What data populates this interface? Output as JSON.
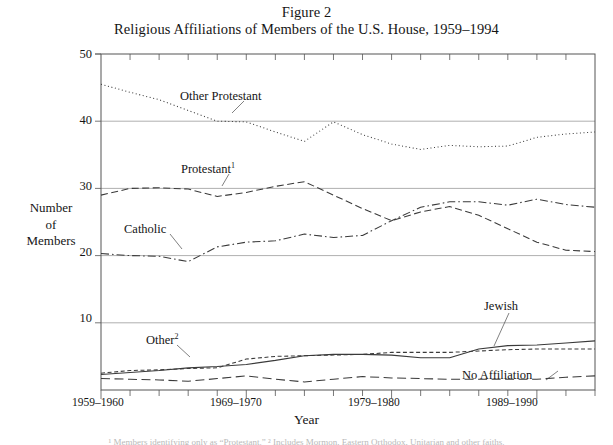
{
  "figure": {
    "title_line_1": "Figure 2",
    "title_line_2": "Religious Affiliations of Members of the U.S. House, 1959–1994",
    "footnote_strip": "¹ Members identifying only as “Protestant.”   ² Includes Mormon, Eastern Orthodox, Unitarian and other faiths."
  },
  "axes": {
    "y_title_line_1": "Number",
    "y_title_line_2": "of",
    "y_title_line_3": "Members",
    "x_title": "Year",
    "y_ticks": [
      "50",
      "40",
      "30",
      "20",
      "10"
    ],
    "x_ticks": [
      "1959–1960",
      "1969–1970",
      "1979–1980",
      "1989–1990"
    ]
  },
  "labels": {
    "other_protestant": "Other Protestant",
    "protestant": "Protestant",
    "protestant_sup": "1",
    "catholic": "Catholic",
    "other": "Other",
    "other_sup": "2",
    "jewish": "Jewish",
    "no_affiliation": "No Affiliation"
  },
  "chart_data": {
    "type": "line",
    "title": "Religious Affiliations of Members of the U.S. House, 1959–1994",
    "subtitle": "Figure 2",
    "xlabel": "Year",
    "ylabel": "Number of Members",
    "ylim": [
      0,
      50
    ],
    "ygrid": true,
    "xgrid": false,
    "legend_position": "inline-annotations",
    "y_ticks": [
      10,
      20,
      30,
      40,
      50
    ],
    "x_tick_labels": [
      "1959–1960",
      "1969–1970",
      "1979–1980",
      "1989–1990"
    ],
    "x_tick_indices": [
      0,
      5,
      10,
      15
    ],
    "categories": [
      "1959–1960",
      "1961–1962",
      "1963–1964",
      "1965–1966",
      "1967–1968",
      "1969–1970",
      "1971–1972",
      "1973–1974",
      "1975–1976",
      "1977–1978",
      "1979–1980",
      "1981–1982",
      "1983–1984",
      "1985–1986",
      "1987–1988",
      "1989–1990",
      "1991–1992",
      "1993–1994"
    ],
    "series": [
      {
        "name": "Other Protestant",
        "style": "dotted",
        "values": [
          45.5,
          44.3,
          43.2,
          41.6,
          40.0,
          39.9,
          38.4,
          37.0,
          39.9,
          38.0,
          36.6,
          35.8,
          36.4,
          36.2,
          36.3,
          37.6,
          38.1,
          38.4
        ]
      },
      {
        "name": "Protestant",
        "style": "dashed",
        "values": [
          29.0,
          30.0,
          30.1,
          29.9,
          28.8,
          29.4,
          30.3,
          31.0,
          29.0,
          27.0,
          25.2,
          26.5,
          27.3,
          26.0,
          24.0,
          22.0,
          20.8,
          20.6
        ]
      },
      {
        "name": "Catholic",
        "style": "dash-dot",
        "values": [
          20.3,
          20.0,
          19.9,
          19.1,
          21.3,
          22.0,
          22.2,
          23.2,
          22.7,
          23.0,
          25.2,
          27.2,
          28.0,
          28.0,
          27.5,
          28.4,
          27.6,
          27.2
        ]
      },
      {
        "name": "Other",
        "style": "short-dash",
        "values": [
          2.5,
          2.9,
          3.0,
          3.2,
          3.3,
          4.6,
          5.0,
          5.1,
          5.2,
          5.3,
          5.6,
          5.6,
          5.6,
          5.8,
          6.0,
          6.1,
          6.1,
          6.1
        ]
      },
      {
        "name": "Jewish",
        "style": "solid",
        "values": [
          2.3,
          2.6,
          2.9,
          3.3,
          3.5,
          3.8,
          4.4,
          5.1,
          5.3,
          5.3,
          5.2,
          4.8,
          4.8,
          6.1,
          6.6,
          6.7,
          7.0,
          7.3
        ]
      },
      {
        "name": "No Affiliation",
        "style": "long-dash",
        "values": [
          1.7,
          1.6,
          1.5,
          1.3,
          1.7,
          2.1,
          1.6,
          1.2,
          1.6,
          2.0,
          1.8,
          1.7,
          1.6,
          1.6,
          1.6,
          1.6,
          1.9,
          2.1
        ]
      }
    ]
  },
  "colors": {
    "ink": "#1a1a1a",
    "axis": "#555555",
    "grid": "#9a9a9a",
    "line": "#3a3a3a",
    "background": "#ffffff"
  }
}
